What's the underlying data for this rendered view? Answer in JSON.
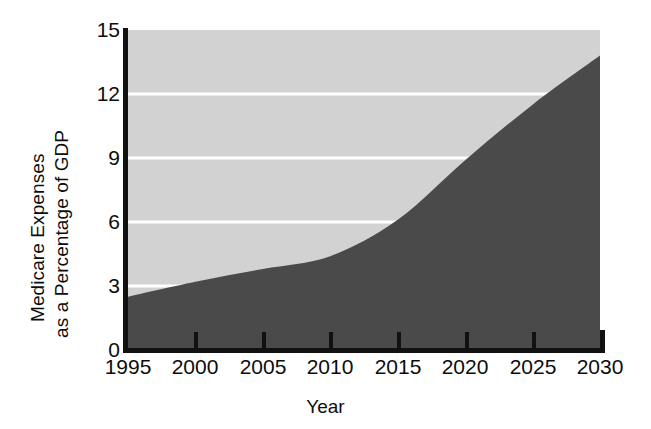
{
  "chart_data": {
    "type": "area",
    "title": "",
    "xlabel": "Year",
    "ylabel": "Medicare Expenses as a Percentage of GDP",
    "ylabel_lines": [
      "Medicare Expenses",
      "as a Percentage of GDP"
    ],
    "x": [
      1995,
      2000,
      2005,
      2010,
      2015,
      2020,
      2025,
      2030
    ],
    "xtick_labels": [
      "1995",
      "2000",
      "2005",
      "2010",
      "2015",
      "2020",
      "2025",
      "2030"
    ],
    "xlim": [
      1995,
      2030
    ],
    "ylim": [
      0,
      15
    ],
    "ytick_labels": [
      "15",
      "12",
      "9",
      "6",
      "3",
      "0"
    ],
    "yticks": [
      15,
      12,
      9,
      6,
      3,
      0
    ],
    "gridlines": [
      12,
      9,
      6,
      3
    ],
    "grid": true,
    "grid_color": "#ffffff",
    "legend": "none",
    "series": [
      {
        "name": "Medicare Expenses as a Percentage of GDP",
        "fill_color": "#4a4a4a",
        "values": [
          2.5,
          3.2,
          3.8,
          4.4,
          6.1,
          8.9,
          11.5,
          13.8
        ]
      }
    ],
    "background_color": "#d2d2d2",
    "axis_color": "#111111",
    "annotations": []
  }
}
